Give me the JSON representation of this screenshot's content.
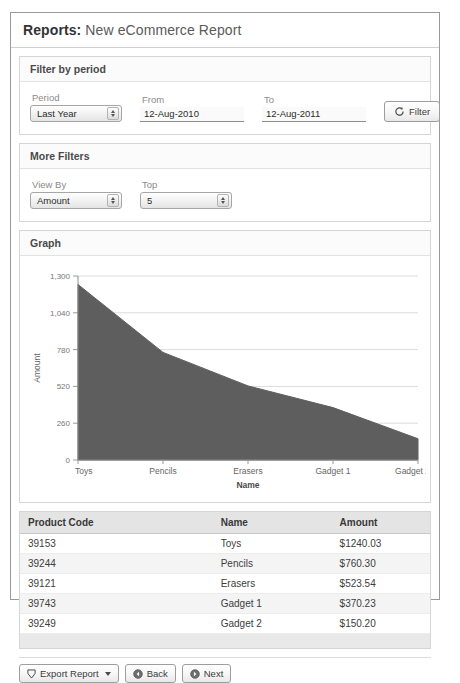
{
  "page": {
    "title_strong": "Reports:",
    "title_rest": "New eCommerce Report"
  },
  "filter_panel": {
    "header": "Filter by period",
    "period_label": "Period",
    "period_value": "Last Year",
    "from_label": "From",
    "from_value": "12-Aug-2010",
    "to_label": "To",
    "to_value": "12-Aug-2011",
    "filter_button": "Filter",
    "filter_icon": "refresh-icon"
  },
  "more_filters_panel": {
    "header": "More Filters",
    "view_by_label": "View By",
    "view_by_value": "Amount",
    "top_label": "Top",
    "top_value": "5"
  },
  "graph_panel": {
    "header": "Graph"
  },
  "chart_data": {
    "type": "area",
    "title": "",
    "categories": [
      "Toys",
      "Pencils",
      "Erasers",
      "Gadget 1",
      "Gadget 2"
    ],
    "values": [
      1240.03,
      760.3,
      523.54,
      370.23,
      150.2
    ],
    "xlabel": "Name",
    "ylabel": "Amount",
    "ylim": [
      0,
      1300
    ],
    "yticks": [
      0,
      260,
      520,
      780,
      1040,
      1300
    ],
    "ytick_labels": [
      "0",
      "260",
      "520",
      "780",
      "1,040",
      "1,300"
    ],
    "grid": true,
    "legend": "none",
    "series_color": "#5e5e5e"
  },
  "table": {
    "columns": [
      "Product Code",
      "Name",
      "Amount"
    ],
    "rows": [
      {
        "code": "39153",
        "name": "Toys",
        "amount": "$1240.03"
      },
      {
        "code": "39244",
        "name": "Pencils",
        "amount": "$760.30"
      },
      {
        "code": "39121",
        "name": "Erasers",
        "amount": "$523.54"
      },
      {
        "code": "39743",
        "name": "Gadget 1",
        "amount": "$370.23"
      },
      {
        "code": "39249",
        "name": "Gadget 2",
        "amount": "$150.20"
      }
    ]
  },
  "footer": {
    "export_label": "Export Report",
    "export_icon": "export-icon",
    "back_label": "Back",
    "back_icon": "back-arrow-icon",
    "next_label": "Next",
    "next_icon": "next-arrow-icon"
  }
}
